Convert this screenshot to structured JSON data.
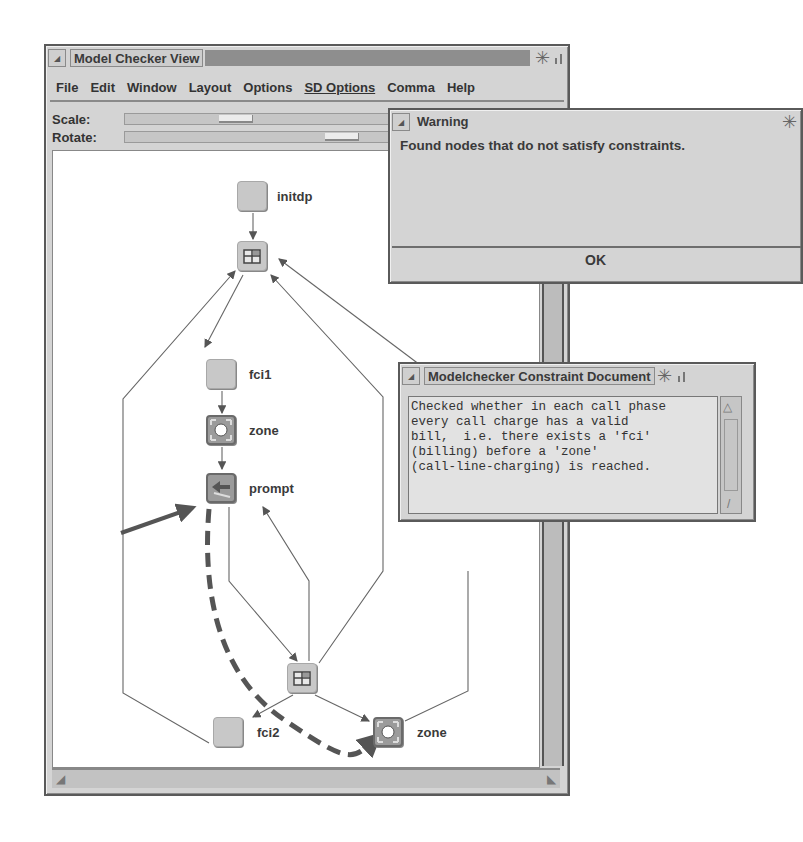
{
  "main_window": {
    "title": "Model Checker View",
    "menu": [
      "File",
      "Edit",
      "Window",
      "Layout",
      "Options",
      "SD Options",
      "Comma",
      "Help"
    ],
    "sliders": [
      {
        "label": "Scale:",
        "thumb_position_px": 100
      },
      {
        "label": "Rotate:",
        "thumb_position_px": 200
      }
    ],
    "graph": {
      "nodes": [
        {
          "id": "initdp",
          "label": "initdp",
          "icon": "blank-node"
        },
        {
          "id": "hub_top",
          "label": "",
          "icon": "grid-node"
        },
        {
          "id": "fci1",
          "label": "fci1",
          "icon": "blank-node"
        },
        {
          "id": "zone1",
          "label": "zone",
          "icon": "zone-node"
        },
        {
          "id": "prompt",
          "label": "prompt",
          "icon": "prompt-node",
          "highlighted": true
        },
        {
          "id": "hub_bottom",
          "label": "",
          "icon": "grid-node"
        },
        {
          "id": "fci2",
          "label": "fci2",
          "icon": "blank-node"
        },
        {
          "id": "zone2",
          "label": "zone",
          "icon": "zone-node"
        }
      ],
      "edges": [
        [
          "initdp",
          "hub_top"
        ],
        [
          "hub_top",
          "fci1"
        ],
        [
          "fci1",
          "zone1"
        ],
        [
          "zone1",
          "prompt"
        ],
        [
          "prompt",
          "hub_bottom"
        ],
        [
          "hub_bottom",
          "prompt"
        ],
        [
          "hub_bottom",
          "fci2"
        ],
        [
          "hub_bottom",
          "zone2"
        ],
        [
          "fci2",
          "hub_top"
        ],
        [
          "hub_bottom",
          "hub_top"
        ],
        [
          "zone2",
          "hub_top"
        ]
      ],
      "counterexample_path": [
        "prompt",
        "zone2"
      ]
    }
  },
  "warning_dialog": {
    "title": "Warning",
    "message": "Found nodes that do not satisfy constraints.",
    "ok_label": "OK"
  },
  "constraint_document": {
    "title": "Modelchecker Constraint Document",
    "text": "Checked whether in each call phase\nevery call charge has a valid\nbill,  i.e. there exists a 'fci'\n(billing) before a 'zone'\n(call-line-charging) is reached."
  }
}
